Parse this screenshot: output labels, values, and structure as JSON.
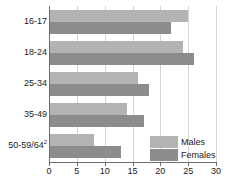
{
  "chart_data": {
    "type": "bar",
    "orientation": "horizontal",
    "title": "",
    "subtitle": "",
    "xlabel": "",
    "ylabel": "",
    "xlim": [
      0,
      30
    ],
    "xticks": [
      0,
      5,
      10,
      15,
      20,
      25,
      30
    ],
    "xtick_labels": [
      "0",
      "5",
      "10",
      "15",
      "20",
      "25",
      "30"
    ],
    "grid": true,
    "grid_axis": "x",
    "legend_position": "bottom-right",
    "categories": [
      "16-17",
      "18-24",
      "25-34",
      "35-49",
      "50-59/64"
    ],
    "category_label_html": [
      "16-17",
      "18-24",
      "25-34",
      "35-49",
      "50-59/64<sup>2</sup>"
    ],
    "category_footnote_marker": "2",
    "series": [
      {
        "name": "Males",
        "color": "#b3b3b3",
        "values": [
          25,
          24,
          16,
          14,
          8
        ]
      },
      {
        "name": "Females",
        "color": "#8c8c8c",
        "values": [
          22,
          26,
          18,
          17,
          13
        ]
      }
    ]
  },
  "legend": {
    "entries": [
      {
        "label": "Males",
        "color": "#b3b3b3"
      },
      {
        "label": "Females",
        "color": "#8c8c8c"
      }
    ]
  },
  "colors": {
    "males": "#b3b3b3",
    "females": "#8c8c8c",
    "axis": "#6e6e6e",
    "grid": "#d5d5d5",
    "text": "#1a1a1a",
    "background": "#ffffff"
  }
}
